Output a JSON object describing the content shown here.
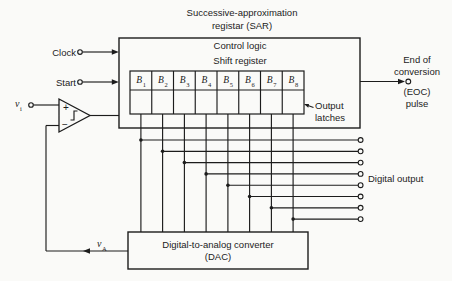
{
  "title": {
    "line1": "Successive-approximation",
    "line2": "registar (SAR)"
  },
  "sar": {
    "control_logic": "Control logic",
    "shift_register": "Shift register",
    "bits": [
      {
        "label": "B",
        "sub": "1"
      },
      {
        "label": "B",
        "sub": "2"
      },
      {
        "label": "B",
        "sub": "3"
      },
      {
        "label": "B",
        "sub": "4"
      },
      {
        "label": "B",
        "sub": "5"
      },
      {
        "label": "B",
        "sub": "6"
      },
      {
        "label": "B",
        "sub": "7"
      },
      {
        "label": "B",
        "sub": "8"
      }
    ],
    "output_latches": {
      "line1": "Output",
      "line2": "latches"
    }
  },
  "inputs": {
    "clock": "Clock",
    "start": "Start",
    "vi": {
      "label": "v",
      "sub": "i"
    }
  },
  "comparator": {
    "plus": "+",
    "minus": "−"
  },
  "eoc": {
    "line1": "End of",
    "line2": "conversion",
    "line3": "(EOC)",
    "line4": "pulse"
  },
  "digital_output_label": "Digital output",
  "dac": {
    "line1": "Digital-to-analog converter",
    "line2": "(DAC)"
  },
  "feedback": {
    "va": {
      "label": "v",
      "sub": "A"
    }
  },
  "colors": {
    "ink": "#1c1c1c",
    "paper": "#fafaf8"
  }
}
